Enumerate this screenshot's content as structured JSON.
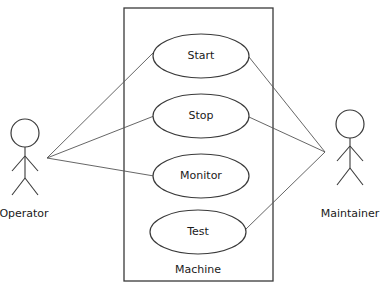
{
  "diagram": {
    "type": "uml-use-case",
    "system": {
      "label": "Machine"
    },
    "use_cases": [
      {
        "id": "start",
        "label": "Start"
      },
      {
        "id": "stop",
        "label": "Stop"
      },
      {
        "id": "monitor",
        "label": "Monitor"
      },
      {
        "id": "test",
        "label": "Test"
      }
    ],
    "actors": [
      {
        "id": "operator",
        "label": "Operator"
      },
      {
        "id": "maintainer",
        "label": "Maintainer"
      }
    ],
    "associations": [
      {
        "actor": "operator",
        "use_case": "start"
      },
      {
        "actor": "operator",
        "use_case": "stop"
      },
      {
        "actor": "operator",
        "use_case": "monitor"
      },
      {
        "actor": "maintainer",
        "use_case": "start"
      },
      {
        "actor": "maintainer",
        "use_case": "stop"
      },
      {
        "actor": "maintainer",
        "use_case": "test"
      }
    ],
    "colors": {
      "line": "#3a3a3a",
      "background": "#ffffff",
      "text": "#1a1a1a"
    }
  }
}
